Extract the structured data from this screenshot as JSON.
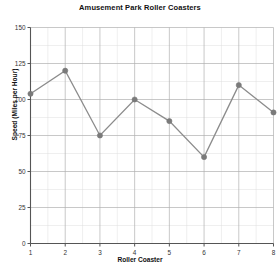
{
  "chart_data": {
    "type": "line",
    "title": "Amusement Park Roller Coasters",
    "xlabel": "Roller Coaster",
    "ylabel": "Speed (Miles per Hour)",
    "x": [
      1,
      2,
      3,
      4,
      5,
      6,
      7,
      8
    ],
    "values": [
      104,
      120,
      75,
      100,
      85,
      60,
      110,
      91
    ],
    "categories": [
      "1",
      "2",
      "3",
      "4",
      "5",
      "6",
      "7",
      "8"
    ],
    "xtick_labels": [
      "1",
      "2",
      "3",
      "4",
      "5",
      "6",
      "7",
      "8"
    ],
    "ytick_labels": [
      "0",
      "25",
      "50",
      "75",
      "100",
      "125",
      "150"
    ],
    "yticks": [
      0,
      25,
      50,
      75,
      100,
      125,
      150
    ],
    "xlim": [
      1,
      8
    ],
    "ylim": [
      0,
      150
    ],
    "grid": true,
    "minor_grid": true,
    "legend": null,
    "legend_position": "none",
    "series_color": "#8c8c8c",
    "marker_color": "#7a7a7a",
    "grid_color": "#b0b0b0",
    "minor_grid_color": "#dedede",
    "axis_color": "#555555"
  }
}
